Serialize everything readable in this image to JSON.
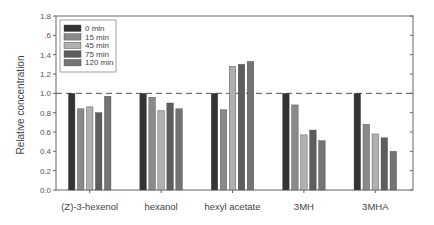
{
  "chart_data": {
    "type": "bar",
    "title": "",
    "xlabel": "",
    "ylabel": "Relative concentration",
    "ylim": [
      0.0,
      1.8
    ],
    "yticks": [
      0.0,
      0.2,
      0.4,
      0.6,
      0.8,
      1.0,
      1.2,
      1.4,
      1.6,
      1.8
    ],
    "ytick_labels": [
      "0.0",
      "0.2",
      "0.4",
      "0.6",
      "0.8",
      "1.0",
      "1.2",
      "1.4",
      ".6",
      "1.8"
    ],
    "grid": false,
    "reference_line": {
      "value": 1.0,
      "style": "dashed"
    },
    "legend_position": "top-left",
    "categories": [
      "(Z)-3-hexenol",
      "hexanol",
      "hexyl acetate",
      "3MH",
      "3MHA"
    ],
    "series": [
      {
        "name": "0 min",
        "color": "#333333",
        "values": [
          1.0,
          1.0,
          1.0,
          1.0,
          1.0
        ]
      },
      {
        "name": "15 min",
        "color": "#8a8a8a",
        "values": [
          0.84,
          0.96,
          0.83,
          0.88,
          0.68
        ]
      },
      {
        "name": "45 min",
        "color": "#b0b0b0",
        "values": [
          0.86,
          0.82,
          1.28,
          0.57,
          0.58
        ]
      },
      {
        "name": "75 min",
        "color": "#5e5e5e",
        "values": [
          0.8,
          0.9,
          1.3,
          0.62,
          0.54
        ]
      },
      {
        "name": "120 min",
        "color": "#747474",
        "values": [
          0.97,
          0.84,
          1.33,
          0.51,
          0.4
        ]
      }
    ]
  }
}
